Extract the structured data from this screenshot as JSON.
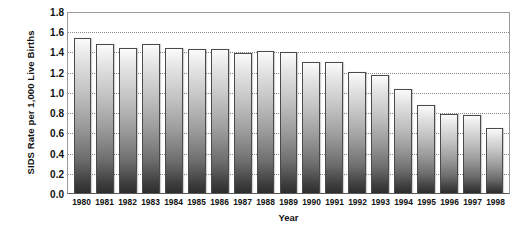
{
  "chart_data": {
    "type": "bar",
    "title": "",
    "xlabel": "Year",
    "ylabel": "SIDS Rate per 1,000 Live Births",
    "ylim": [
      0.0,
      1.8
    ],
    "ytick_labels": [
      "1.8",
      "1.6",
      "1.4",
      "1.2",
      "1.0",
      "0.8",
      "0.6",
      "0.4",
      "0.2",
      "0.0"
    ],
    "ytick_values": [
      1.8,
      1.6,
      1.4,
      1.2,
      1.0,
      0.8,
      0.6,
      0.4,
      0.2,
      0.0
    ],
    "grid": "horizontal-dotted",
    "legend": "none",
    "categories": [
      "1980",
      "1981",
      "1982",
      "1983",
      "1984",
      "1985",
      "1986",
      "1987",
      "1988",
      "1989",
      "1990",
      "1991",
      "1992",
      "1993",
      "1994",
      "1995",
      "1996",
      "1997",
      "1998"
    ],
    "values": [
      1.53,
      1.47,
      1.43,
      1.47,
      1.43,
      1.42,
      1.42,
      1.38,
      1.4,
      1.39,
      1.3,
      1.3,
      1.2,
      1.17,
      1.03,
      0.87,
      0.78,
      0.77,
      0.64
    ],
    "bar_fill": "#9c9c9c",
    "bar_border": "#4a4a4a",
    "grid_color": "#888888",
    "axis_color": "#5a5a5a",
    "background": "#ffffff"
  }
}
